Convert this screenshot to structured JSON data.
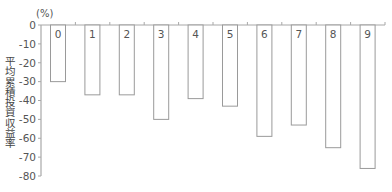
{
  "chart_data": {
    "type": "bar",
    "title": "",
    "unit_label": "(%)",
    "xlabel": "",
    "ylabel": "平均累積投資収益率",
    "categories": [
      "0",
      "1",
      "2",
      "3",
      "4",
      "5",
      "6",
      "7",
      "8",
      "9"
    ],
    "values": [
      -30,
      -37,
      -37,
      -50,
      -39,
      -43,
      -59,
      -53,
      -65,
      -76
    ],
    "ylim": [
      -80,
      0
    ],
    "yticks": [
      0,
      -10,
      -20,
      -30,
      -40,
      -50,
      -60,
      -70,
      -80
    ],
    "grid": false,
    "legend": null,
    "category_labels_position": "inside-top-of-bar",
    "colors": {
      "bar_fill": "#ffffff",
      "bar_stroke": "#9a9a9a",
      "axis": "#a8a8a8",
      "text": "#555555"
    }
  }
}
